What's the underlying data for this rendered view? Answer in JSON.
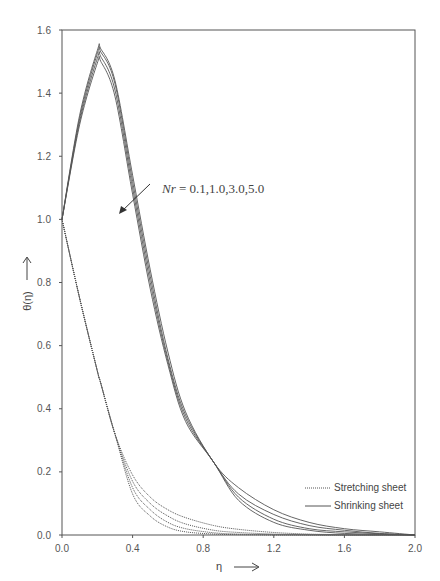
{
  "chart_data": {
    "type": "line",
    "title": "",
    "xlabel": "η",
    "ylabel": "θ(η)",
    "xlim": [
      0.0,
      2.0
    ],
    "ylim": [
      0.0,
      1.6
    ],
    "x_ticks": [
      "0.0",
      "0.4",
      "0.8",
      "1.2",
      "1.6",
      "2.0"
    ],
    "y_ticks": [
      "0.0",
      "0.2",
      "0.4",
      "0.6",
      "0.8",
      "1.0",
      "1.2",
      "1.4",
      "1.6"
    ],
    "grid": false,
    "legend_position": "lower right",
    "legend": [
      {
        "label": "Stretching sheet",
        "style": "dotted"
      },
      {
        "label": "Shrinking sheet",
        "style": "solid"
      }
    ],
    "annotation": {
      "text": "Nr = 0.1,1.0,3.0,5.0",
      "italic_part": "Nr",
      "rest": " = 0.1,1.0,3.0,5.0"
    },
    "x": [
      0.0,
      0.1,
      0.2,
      0.22,
      0.3,
      0.4,
      0.5,
      0.6,
      0.7,
      0.86,
      1.0,
      1.2,
      1.4,
      1.6,
      1.8,
      2.0
    ],
    "series": [
      {
        "name": "Shrinking Nr=0.1",
        "style": "solid",
        "values": [
          1.0,
          1.33,
          1.535,
          1.54,
          1.44,
          1.14,
          0.84,
          0.58,
          0.39,
          0.23,
          0.15,
          0.08,
          0.04,
          0.02,
          0.01,
          0.0
        ]
      },
      {
        "name": "Shrinking Nr=1.0",
        "style": "solid",
        "values": [
          1.0,
          1.32,
          1.525,
          1.53,
          1.43,
          1.12,
          0.82,
          0.56,
          0.38,
          0.23,
          0.13,
          0.065,
          0.03,
          0.015,
          0.005,
          0.0
        ]
      },
      {
        "name": "Shrinking Nr=3.0",
        "style": "solid",
        "values": [
          1.0,
          1.31,
          1.51,
          1.515,
          1.41,
          1.1,
          0.8,
          0.55,
          0.37,
          0.23,
          0.12,
          0.05,
          0.02,
          0.01,
          0.004,
          0.0
        ]
      },
      {
        "name": "Shrinking Nr=5.0",
        "style": "solid",
        "values": [
          1.0,
          1.3,
          1.495,
          1.5,
          1.39,
          1.08,
          0.78,
          0.54,
          0.36,
          0.23,
          0.11,
          0.04,
          0.015,
          0.005,
          0.002,
          0.0
        ]
      },
      {
        "name": "Stretching Nr=0.1",
        "style": "dotted",
        "values": [
          1.0,
          0.75,
          0.52,
          0.48,
          0.32,
          0.19,
          0.12,
          0.08,
          0.055,
          0.03,
          0.018,
          0.008,
          0.003,
          0.001,
          0.0,
          0.0
        ]
      },
      {
        "name": "Stretching Nr=1.0",
        "style": "dotted",
        "values": [
          1.0,
          0.75,
          0.52,
          0.48,
          0.32,
          0.17,
          0.1,
          0.06,
          0.035,
          0.015,
          0.008,
          0.003,
          0.001,
          0.0,
          0.0,
          0.0
        ]
      },
      {
        "name": "Stretching Nr=3.0",
        "style": "dotted",
        "values": [
          1.0,
          0.75,
          0.52,
          0.48,
          0.32,
          0.15,
          0.08,
          0.04,
          0.02,
          0.007,
          0.003,
          0.001,
          0.0,
          0.0,
          0.0,
          0.0
        ]
      },
      {
        "name": "Stretching Nr=5.0",
        "style": "dotted",
        "values": [
          1.0,
          0.75,
          0.52,
          0.48,
          0.32,
          0.13,
          0.06,
          0.025,
          0.01,
          0.003,
          0.001,
          0.0,
          0.0,
          0.0,
          0.0,
          0.0
        ]
      }
    ]
  },
  "labels": {
    "xlabel": "η",
    "ylabel": "θ(η)",
    "annotation_var": "Nr",
    "annotation_rest": " = 0.1,1.0,3.0,5.0",
    "legend_stretching": "Stretching sheet",
    "legend_shrinking": "Shrinking sheet"
  },
  "colors": {
    "axis": "#444444",
    "line": "#555555",
    "text": "#555555"
  }
}
